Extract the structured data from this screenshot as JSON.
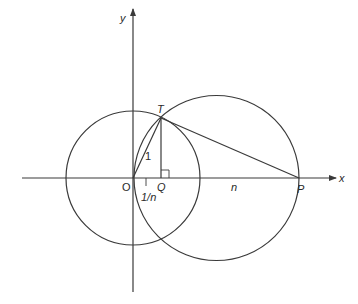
{
  "figure": {
    "axes": {
      "x_label": "x",
      "y_label": "y"
    },
    "points": {
      "O": "O",
      "Q": "Q",
      "T": "T",
      "P": "P"
    },
    "segment_labels": {
      "OT": "1",
      "OQ": "1/n",
      "QP": "n"
    },
    "colors": {
      "stroke": "#3a3a3a",
      "background": "#ffffff"
    }
  }
}
